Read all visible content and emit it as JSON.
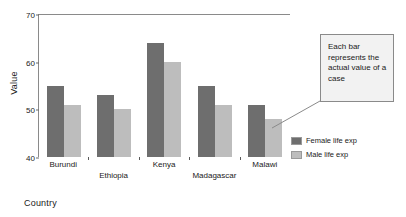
{
  "chart_data": {
    "type": "bar",
    "title": "",
    "subtitle": "",
    "xlabel": "Country",
    "ylabel": "Value",
    "ylim": [
      40,
      70
    ],
    "yticks": [
      40,
      50,
      60,
      70
    ],
    "grid": false,
    "legend_position": "right",
    "categories": [
      "Burundi",
      "Ethiopia",
      "Kenya",
      "Madagascar",
      "Malawi"
    ],
    "series": [
      {
        "name": "Female life exp",
        "color": "#6e6e6e",
        "values": [
          55,
          53,
          64,
          55,
          51
        ]
      },
      {
        "name": "Male life exp",
        "color": "#bdbdbd",
        "values": [
          51,
          50,
          60,
          51,
          48
        ]
      }
    ],
    "annotations": [
      {
        "text": "Each bar represents the actual value of a case",
        "target": "Malawi male bar"
      }
    ]
  },
  "axes": {
    "y_title": "Value",
    "x_title": "Country",
    "y_tick_labels": [
      "70",
      "60",
      "50",
      "40"
    ]
  },
  "legend": {
    "items": [
      {
        "label": "Female life exp",
        "color": "#6e6e6e"
      },
      {
        "label": "Male life exp",
        "color": "#bdbdbd"
      }
    ]
  },
  "callout": {
    "text": "Each bar represents the actual value of a case"
  },
  "colors": {
    "female": "#6e6e6e",
    "male": "#bdbdbd",
    "axis": "#8a8a8a",
    "callout_bg": "#f2f2f2",
    "callout_border": "#8a8a8a",
    "text": "#1a1a1a"
  }
}
